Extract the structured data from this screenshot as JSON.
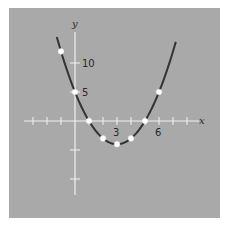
{
  "chart_data": {
    "type": "line",
    "title": "",
    "xlabel": "x",
    "ylabel": "y",
    "function": "y = x^2 - 6x + 5",
    "x_tick_labels": [
      "3",
      "6"
    ],
    "y_tick_labels": [
      "5",
      "10"
    ],
    "xlim": [
      -3.5,
      8.5
    ],
    "ylim": [
      -11,
      13
    ],
    "grid": false,
    "legend": null,
    "points": [
      {
        "x": -1,
        "y": 12
      },
      {
        "x": 0,
        "y": 5
      },
      {
        "x": 1,
        "y": 0
      },
      {
        "x": 2,
        "y": -3
      },
      {
        "x": 3,
        "y": -4
      },
      {
        "x": 4,
        "y": -3
      },
      {
        "x": 5,
        "y": 0
      },
      {
        "x": 6,
        "y": 5
      }
    ],
    "curve_x_range": [
      -1.3,
      7.2
    ],
    "colors": {
      "background": "#a9a9a9",
      "axes": "#f2f2f2",
      "curve": "#333333",
      "points": "#ffffff"
    }
  },
  "labels": {
    "x_axis": "x",
    "y_axis": "y",
    "tick_3": "3",
    "tick_6": "6",
    "tick_5": "5",
    "tick_10": "10"
  }
}
